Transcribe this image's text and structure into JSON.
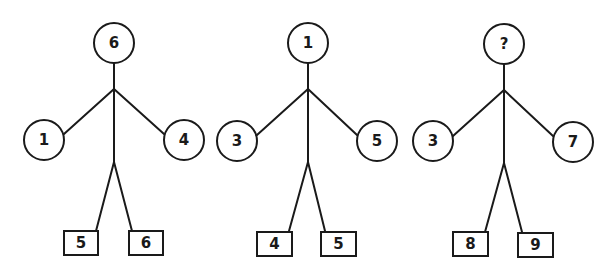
{
  "puzzle": {
    "figures": [
      {
        "head": "6",
        "left_hand": "1",
        "right_hand": "4",
        "left_foot": "5",
        "right_foot": "6"
      },
      {
        "head": "1",
        "left_hand": "3",
        "right_hand": "5",
        "left_foot": "4",
        "right_foot": "5"
      },
      {
        "head": "?",
        "left_hand": "3",
        "right_hand": "7",
        "left_foot": "8",
        "right_foot": "9"
      }
    ]
  },
  "colors": {
    "line": "#1a1a1a",
    "background": "#ffffff"
  }
}
